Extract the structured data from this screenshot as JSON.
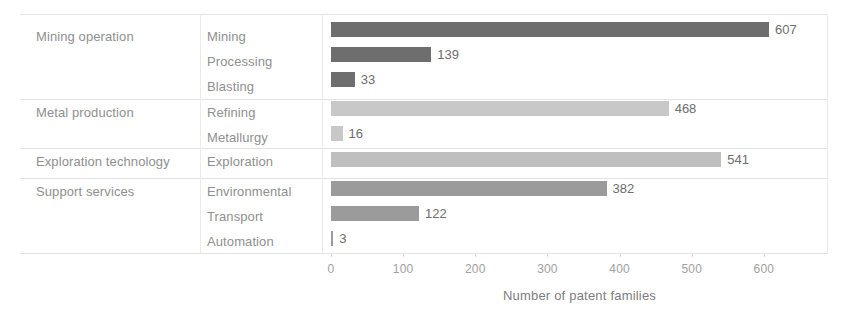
{
  "chart_data": {
    "type": "bar",
    "orientation": "horizontal",
    "title": "",
    "xlabel": "Number of patent families",
    "ylabel": "",
    "xlim": [
      0,
      640
    ],
    "xticks": [
      0,
      100,
      200,
      300,
      400,
      500,
      600
    ],
    "grid": false,
    "legend": "none",
    "categories": [
      "Mining",
      "Processing",
      "Blasting",
      "Refining",
      "Metallurgy",
      "Exploration",
      "Environmental",
      "Transport",
      "Automation"
    ],
    "values": [
      607,
      139,
      33,
      468,
      16,
      541,
      382,
      122,
      3
    ],
    "groups": [
      {
        "label": "Mining operation",
        "color": "#6e6e6e",
        "items": [
          {
            "label": "Mining",
            "value": 607
          },
          {
            "label": "Processing",
            "value": 139
          },
          {
            "label": "Blasting",
            "value": 33
          }
        ]
      },
      {
        "label": "Metal production",
        "color": "#c8c8c8",
        "items": [
          {
            "label": "Refining",
            "value": 468
          },
          {
            "label": "Metallurgy",
            "value": 16
          }
        ]
      },
      {
        "label": "Exploration technology",
        "color": "#bfbfbf",
        "items": [
          {
            "label": "Exploration",
            "value": 541
          }
        ]
      },
      {
        "label": "Support services",
        "color": "#9b9b9b",
        "items": [
          {
            "label": "Environmental",
            "value": 382
          },
          {
            "label": "Transport",
            "value": 122
          },
          {
            "label": "Automation",
            "value": 3
          }
        ]
      }
    ]
  },
  "axis": {
    "title": "Number of patent families",
    "tick_labels": [
      "0",
      "100",
      "200",
      "300",
      "400",
      "500",
      "600"
    ]
  },
  "colors": {
    "group1_bar": "#6e6e6e",
    "group2_bar": "#c8c8c8",
    "group3_bar": "#bfbfbf",
    "group4_bar": "#9b9b9b",
    "rule": "#e3e3e3",
    "label_text": "#8f8f8f",
    "value_text": "#6d6d6d",
    "background": "#ffffff"
  }
}
